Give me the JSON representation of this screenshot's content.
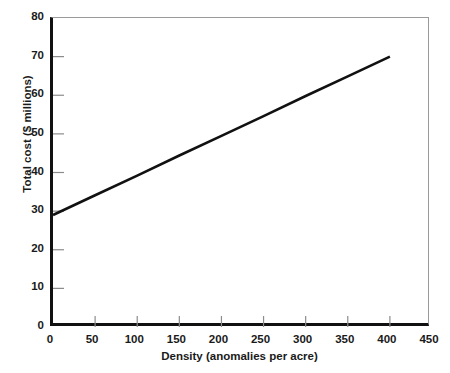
{
  "chart_data": {
    "type": "line",
    "title": "",
    "subtitle": "",
    "xlabel": "Density (anomalies per acre)",
    "ylabel": "Total cost ($ millions)",
    "xlim": [
      0,
      450
    ],
    "ylim": [
      0,
      80
    ],
    "xticks": [
      0,
      50,
      100,
      150,
      200,
      250,
      300,
      350,
      400,
      450
    ],
    "yticks": [
      0,
      10,
      20,
      30,
      40,
      50,
      60,
      70,
      80
    ],
    "xtick_labels": [
      "0",
      "50",
      "100",
      "150",
      "200",
      "250",
      "300",
      "350",
      "400",
      "450"
    ],
    "ytick_labels": [
      "0",
      "10",
      "20",
      "30",
      "40",
      "50",
      "60",
      "70",
      "80"
    ],
    "grid": false,
    "legend": false,
    "legend_position": "none",
    "annotations": [],
    "series": [
      {
        "name": "Total cost",
        "color": "#111111",
        "line_width": 2.6,
        "x": [
          0,
          50,
          100,
          150,
          200,
          250,
          300,
          350,
          400
        ],
        "values": [
          29.0,
          34.1,
          39.2,
          44.4,
          49.5,
          54.6,
          59.8,
          64.9,
          70.0
        ]
      }
    ]
  },
  "axes": {
    "y_axis_label": "Total cost ($ millions)",
    "x_axis_label": "Density (anomalies per acre)"
  },
  "colors": {
    "line": "#111111",
    "axis": "#111111",
    "frame": "#9a9a9a",
    "tick": "#8c8c8c",
    "background": "#ffffff",
    "text": "#1a1a1a"
  }
}
